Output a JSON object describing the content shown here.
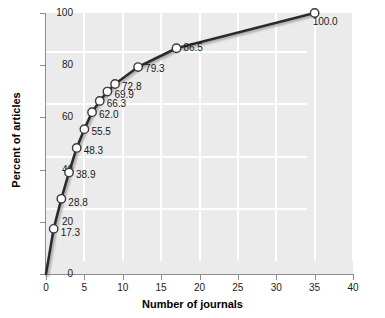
{
  "chart_data": {
    "type": "line",
    "title": "",
    "xlabel": "Number of journals",
    "ylabel": "Percent of articles",
    "xlim": [
      0,
      40
    ],
    "ylim": [
      0,
      100
    ],
    "xticks": [
      0,
      5,
      10,
      15,
      20,
      25,
      30,
      35,
      40
    ],
    "xtick_labels": [
      "0",
      "5",
      "10",
      "15",
      "20",
      "25",
      "30",
      "35",
      "40"
    ],
    "yticks": [
      0,
      20,
      40,
      60,
      80,
      100
    ],
    "ytick_labels": [
      "0",
      "20",
      "40",
      "60",
      "80",
      "100"
    ],
    "grid": true,
    "legend": "none",
    "x": [
      1,
      2,
      3,
      4,
      5,
      6,
      7,
      8,
      9,
      12,
      17,
      35
    ],
    "values": [
      17.3,
      28.8,
      38.9,
      48.3,
      55.5,
      62.0,
      66.3,
      69.9,
      72.8,
      79.3,
      86.5,
      100.0
    ],
    "point_labels": [
      "17.3",
      "28.8",
      "38.9",
      "48.3",
      "55.5",
      "62.0",
      "66.3",
      "69.9",
      "72.8",
      "79.3",
      "86.5",
      "100.0"
    ],
    "series": [
      {
        "name": "Cumulative percent of articles",
        "x": [
          1,
          2,
          3,
          4,
          5,
          6,
          7,
          8,
          9,
          12,
          17,
          35
        ],
        "values": [
          17.3,
          28.8,
          38.9,
          48.3,
          55.5,
          62.0,
          66.3,
          69.9,
          72.8,
          79.3,
          86.5,
          100.0
        ]
      }
    ],
    "colors": {
      "panel_background": "#ebebeb",
      "gridline": "#ffffff",
      "line": "#2b2b2b",
      "marker_fill": "#ffffff",
      "marker_edge": "#3a3a3a",
      "axis": "#8c8c8c",
      "text": "#1a1a1a"
    }
  }
}
